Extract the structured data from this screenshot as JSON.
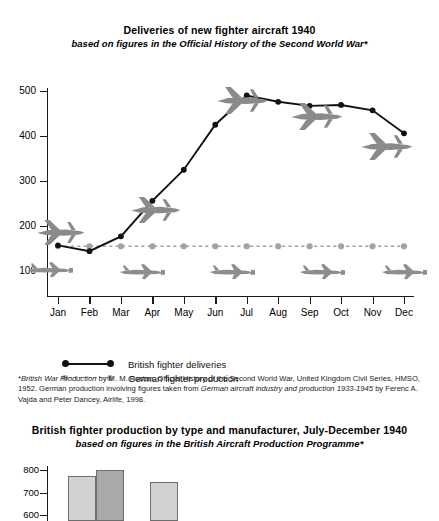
{
  "chart_data": [
    {
      "type": "line",
      "title": "Deliveries of new fighter aircraft 1940",
      "subtitle": "based on figures in the Official History of the Second World War*",
      "xlabel": "",
      "ylabel": "",
      "categories": [
        "Jan",
        "Feb",
        "Mar",
        "Apr",
        "May",
        "Jun",
        "Jul",
        "Aug",
        "Sep",
        "Oct",
        "Nov",
        "Dec"
      ],
      "ylim": [
        0,
        520
      ],
      "yticks": [
        100,
        200,
        300,
        400,
        500
      ],
      "grid": false,
      "legend_position": "below-left",
      "series": [
        {
          "name": "British fighter deliveries",
          "color": "#111111",
          "style": "solid",
          "marker": "circle",
          "values": [
            157,
            144,
            177,
            256,
            325,
            425,
            490,
            476,
            467,
            469,
            457,
            406
          ]
        },
        {
          "name": "German fighter production",
          "color": "#a3a3a3",
          "style": "dashed",
          "marker": "circle",
          "values": [
            155,
            155,
            155,
            155,
            155,
            155,
            155,
            155,
            155,
            155,
            155,
            155
          ]
        }
      ]
    },
    {
      "type": "bar",
      "title": "British fighter production by type and manufacturer, July-December 1940",
      "subtitle": "based on figures in the British Aircraft Production Programme*",
      "categories": [
        "",
        "",
        ""
      ],
      "values": [
        775,
        800,
        745
      ],
      "colors": [
        "#d2d2d2",
        "#a9a9a9",
        "#d2d2d2"
      ],
      "yticks": [
        600,
        700,
        800
      ],
      "ylim": [
        500,
        840
      ],
      "grid": false,
      "note": "chart clipped by bottom edge of screenshot"
    }
  ],
  "chart1": {
    "title": "Deliveries of new fighter aircraft 1940",
    "subtitle": "based on figures in the Official History of the Second World War*",
    "y_ticks": [
      "500",
      "400",
      "300",
      "200",
      "100"
    ],
    "x_ticks": [
      "Jan",
      "Feb",
      "Mar",
      "Apr",
      "May",
      "Jun",
      "Jul",
      "Aug",
      "Sep",
      "Oct",
      "Nov",
      "Dec"
    ],
    "legend": [
      {
        "label": "British fighter deliveries",
        "color": "#111111",
        "style": "solid"
      },
      {
        "label": "German fighter production",
        "color": "#a3a3a3",
        "style": "dashed"
      }
    ]
  },
  "footnote": {
    "marker": "*",
    "part1_italic": "British War Production",
    "part2": " by M. M. Postan, Official History of the Second World War, United Kingdom Civil Series, HMSO, 1952. German production involving figures taken from ",
    "part3_italic": "German aircraft industry and production 1933-1945",
    "part4": " by Ferenc A. Vajda and Peter Dancey, Airlife, 1998."
  },
  "chart2": {
    "title": "British fighter production by type and manufacturer, July-December 1940",
    "subtitle": "based on figures in the British Aircraft Production Programme*",
    "y_ticks": [
      "800",
      "700",
      "600"
    ]
  }
}
